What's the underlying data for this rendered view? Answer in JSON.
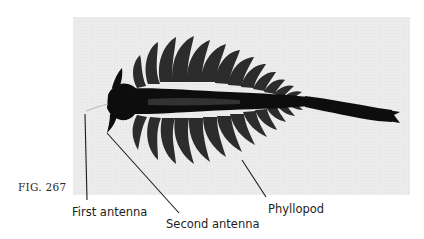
{
  "figure": {
    "number": "FIG. 267",
    "photo": {
      "background": "#ebebeb",
      "subject": "fairy shrimp (anostracan) dorsal view",
      "subject_color": "#0d0d0d"
    },
    "labels": [
      {
        "id": "first-antenna",
        "text": "First antenna"
      },
      {
        "id": "second-antenna",
        "text": "Second antenna"
      },
      {
        "id": "phyllopod",
        "text": "Phyllopod"
      }
    ]
  }
}
